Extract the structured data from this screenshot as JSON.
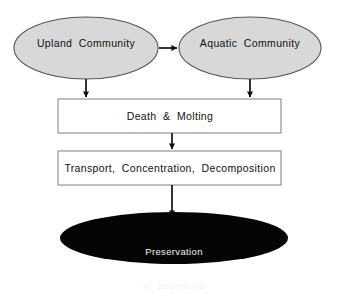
{
  "diagram": {
    "background_color": "#ffffff",
    "ellipse_fill": "#d8d8d8",
    "ellipse_stroke": "#555555",
    "box_fill": "#ffffff",
    "box_stroke": "#8a8a8a",
    "terminal_fill": "#050505",
    "arrow_color": "#111111",
    "dark_text_color": "#111111",
    "light_text_color": "#f2f2f2",
    "nodes": {
      "upland": {
        "label": "Upland  Community",
        "shape": "ellipse",
        "fill": "#d8d8d8"
      },
      "aquatic": {
        "label": "Aquatic  Community",
        "shape": "ellipse",
        "fill": "#d8d8d8"
      },
      "death": {
        "label": "Death  &  Molting",
        "shape": "rectangle",
        "fill": "#ffffff"
      },
      "transport": {
        "label": "Transport,  Concentration,  Decomposition",
        "shape": "rectangle",
        "fill": "#ffffff"
      },
      "preservation": {
        "label_line1": "Preservation",
        "label_line2": "in  Sediments",
        "shape": "ellipse",
        "fill": "#050505"
      }
    },
    "connectors": [
      {
        "name": "upland-to-aquatic",
        "from": "upland",
        "to": "aquatic",
        "direction": "right"
      },
      {
        "name": "upland-to-death",
        "from": "upland",
        "to": "death",
        "direction": "down"
      },
      {
        "name": "aquatic-to-death",
        "from": "aquatic",
        "to": "death",
        "direction": "down"
      },
      {
        "name": "death-to-transport",
        "from": "death",
        "to": "transport",
        "direction": "down"
      },
      {
        "name": "transport-to-preservation",
        "from": "transport",
        "to": "preservation",
        "direction": "down"
      }
    ]
  }
}
